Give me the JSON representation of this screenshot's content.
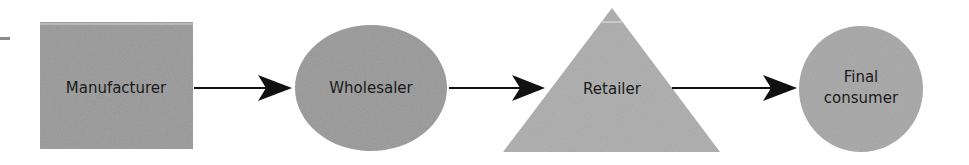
{
  "diagram": {
    "title": "",
    "nodes": [
      {
        "id": "manufacturer",
        "label": "Manufacturer",
        "shape": "rectangle",
        "color": "#9a9a9a"
      },
      {
        "id": "wholesaler",
        "label": "Wholesaler",
        "shape": "ellipse",
        "color": "#9a9a9a"
      },
      {
        "id": "retailer",
        "label": "Retailer",
        "shape": "triangle",
        "color": "#aeaeae"
      },
      {
        "id": "final-consumer",
        "label_line1": "Final",
        "label_line2": "consumer",
        "shape": "circle",
        "color": "#a8a8a8"
      }
    ],
    "edges": [
      {
        "from": "manufacturer",
        "to": "wholesaler"
      },
      {
        "from": "wholesaler",
        "to": "retailer"
      },
      {
        "from": "retailer",
        "to": "final-consumer"
      }
    ],
    "colors": {
      "arrow": "#111111",
      "text": "#1a1a1a",
      "background": "#ffffff"
    }
  }
}
